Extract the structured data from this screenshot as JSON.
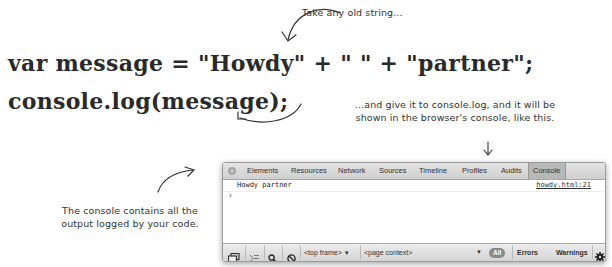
{
  "annotations": {
    "top": "Take any old string...",
    "middle_line1": "...and give it to console.log, and it will be",
    "middle_line2": "shown in the browser's console, like this.",
    "left_line1": "The console contains all the",
    "left_line2": "output logged by your code."
  },
  "code": {
    "line1": "var message = \"Howdy\" + \" \" + \"partner\";",
    "line2": "console.log(message);"
  },
  "console_window": {
    "tabs": [
      {
        "label": "Elements",
        "active": false
      },
      {
        "label": "Resources",
        "active": false
      },
      {
        "label": "Network",
        "active": false
      },
      {
        "label": "Sources",
        "active": false
      },
      {
        "label": "Timeline",
        "active": false
      },
      {
        "label": "Profiles",
        "active": false
      },
      {
        "label": "Audits",
        "active": false
      },
      {
        "label": "Console",
        "active": true
      }
    ],
    "close_icon": "×",
    "log": {
      "message": "Howdy partner",
      "source": "howdy.html:21"
    },
    "prompt": "›",
    "toolbar": {
      "frame_select": "<top frame>",
      "context_select": "<page context>",
      "filter_all": "All",
      "filter_errors": "Errors",
      "filter_warnings": "Warnings",
      "dropdown_glyph": "▼",
      "icons": [
        "dock-icon",
        "console-drawer-icon",
        "search-icon",
        "clear-icon",
        "gear-icon"
      ]
    }
  }
}
